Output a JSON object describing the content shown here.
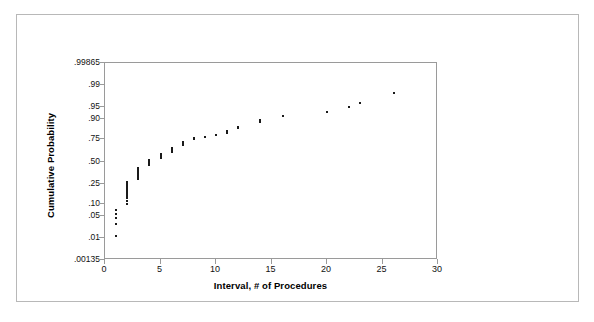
{
  "figure": {
    "background_color": "#ffffff",
    "border_color": "#b8b8b8",
    "axis_color": "#9a9a9a",
    "marker_color": "#1a1a1a"
  },
  "chart_data": {
    "type": "scatter",
    "title": "",
    "subtitle": "",
    "xlabel": "Interval, # of Procedures",
    "ylabel": "Cumulative Probability",
    "plot_kind": "normal probability plot",
    "grid": false,
    "legend": null,
    "xlim": [
      0,
      30
    ],
    "ylim": [
      0.00135,
      0.99865
    ],
    "y_scale": "normal probability (probit)",
    "xticks": [
      0,
      5,
      10,
      15,
      20,
      25,
      30
    ],
    "xtick_labels": [
      "0",
      "5",
      "10",
      "15",
      "20",
      "25",
      "30"
    ],
    "yticks": [
      0.00135,
      0.01,
      0.05,
      0.1,
      0.25,
      0.5,
      0.75,
      0.9,
      0.95,
      0.99,
      0.99865
    ],
    "ytick_labels": [
      ".00135",
      ".01",
      ".05",
      ".10",
      ".25",
      ".50",
      ".75",
      ".90",
      ".95",
      ".99",
      ".99865"
    ],
    "series": [
      {
        "name": "Cumulative probability of interval",
        "marker": "square",
        "points": [
          {
            "x": 1,
            "y": 0.012
          },
          {
            "x": 1,
            "y": 0.028
          },
          {
            "x": 1,
            "y": 0.042
          },
          {
            "x": 1,
            "y": 0.055
          },
          {
            "x": 1,
            "y": 0.07
          },
          {
            "x": 2,
            "y": 0.1
          },
          {
            "x": 2,
            "y": 0.115
          },
          {
            "x": 2,
            "y": 0.13
          },
          {
            "x": 2,
            "y": 0.145
          },
          {
            "x": 2,
            "y": 0.16
          },
          {
            "x": 2,
            "y": 0.175
          },
          {
            "x": 2,
            "y": 0.19
          },
          {
            "x": 2,
            "y": 0.205
          },
          {
            "x": 2,
            "y": 0.22
          },
          {
            "x": 2,
            "y": 0.235
          },
          {
            "x": 2,
            "y": 0.25
          },
          {
            "x": 2,
            "y": 0.265
          },
          {
            "x": 3,
            "y": 0.3
          },
          {
            "x": 3,
            "y": 0.32
          },
          {
            "x": 3,
            "y": 0.34
          },
          {
            "x": 3,
            "y": 0.36
          },
          {
            "x": 3,
            "y": 0.38
          },
          {
            "x": 3,
            "y": 0.4
          },
          {
            "x": 3,
            "y": 0.42
          },
          {
            "x": 4,
            "y": 0.455
          },
          {
            "x": 4,
            "y": 0.475
          },
          {
            "x": 4,
            "y": 0.495
          },
          {
            "x": 4,
            "y": 0.515
          },
          {
            "x": 5,
            "y": 0.545
          },
          {
            "x": 5,
            "y": 0.565
          },
          {
            "x": 5,
            "y": 0.585
          },
          {
            "x": 6,
            "y": 0.615
          },
          {
            "x": 6,
            "y": 0.63
          },
          {
            "x": 6,
            "y": 0.645
          },
          {
            "x": 6,
            "y": 0.66
          },
          {
            "x": 7,
            "y": 0.69
          },
          {
            "x": 7,
            "y": 0.705
          },
          {
            "x": 7,
            "y": 0.72
          },
          {
            "x": 8,
            "y": 0.75
          },
          {
            "x": 8,
            "y": 0.76
          },
          {
            "x": 9,
            "y": 0.775
          },
          {
            "x": 10,
            "y": 0.79
          },
          {
            "x": 11,
            "y": 0.805
          },
          {
            "x": 11,
            "y": 0.82
          },
          {
            "x": 12,
            "y": 0.845
          },
          {
            "x": 12,
            "y": 0.855
          },
          {
            "x": 14,
            "y": 0.885
          },
          {
            "x": 14,
            "y": 0.895
          },
          {
            "x": 16,
            "y": 0.915
          },
          {
            "x": 20,
            "y": 0.935
          },
          {
            "x": 22,
            "y": 0.95
          },
          {
            "x": 23,
            "y": 0.963
          },
          {
            "x": 26,
            "y": 0.982
          }
        ]
      }
    ]
  }
}
